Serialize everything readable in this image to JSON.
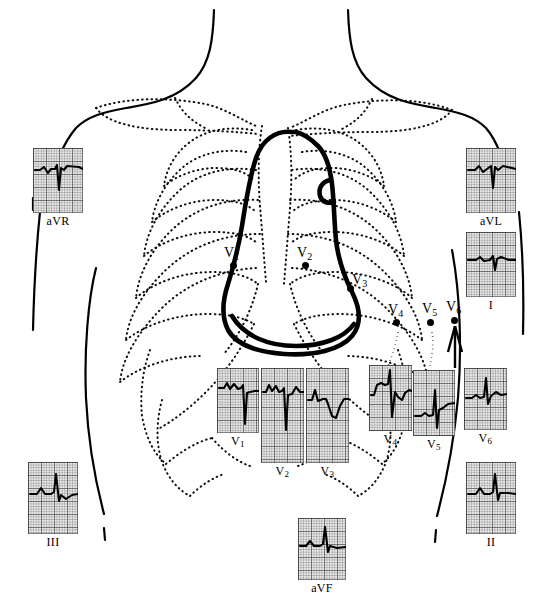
{
  "figure": {
    "kind": "anatomical-diagram"
  },
  "torso": {
    "body_outline_name": "chest-torso-outline",
    "heart_outline_name": "heart-silhouette",
    "ribcage_name": "ribcage-dotted-outline",
    "stroke_color": "#000000",
    "dotted_color": "#111111"
  },
  "electrodes": [
    {
      "id": "V1",
      "label": "V",
      "sub": "1",
      "dot_x": 233,
      "dot_y": 265,
      "label_x": 224,
      "label_y": 247
    },
    {
      "id": "V2",
      "label": "V",
      "sub": "2",
      "dot_x": 305,
      "dot_y": 265,
      "label_x": 297,
      "label_y": 247
    },
    {
      "id": "V3",
      "label": "V",
      "sub": "3",
      "dot_x": 350,
      "dot_y": 288,
      "label_x": 352,
      "label_y": 272
    },
    {
      "id": "V4",
      "label": "V",
      "sub": "4",
      "dot_x": 396,
      "dot_y": 322,
      "label_x": 390,
      "label_y": 304
    },
    {
      "id": "V5",
      "label": "V",
      "sub": "5",
      "dot_x": 430,
      "dot_y": 322,
      "label_x": 424,
      "label_y": 303
    },
    {
      "id": "V6",
      "label": "V",
      "sub": "6",
      "dot_x": 454,
      "dot_y": 320,
      "label_x": 448,
      "label_y": 300
    }
  ],
  "strips": [
    {
      "id": "aVR",
      "label": "aVR",
      "sub": "",
      "x": 33,
      "y": 148,
      "w": 50,
      "h": 65,
      "label_top": 66,
      "trace": "M2,22 L7,22 L11,19 L15,25 L18,21 L22,21 L24,17 L26,42 L28,20 L31,22 L34,18 L46,19 L50,21"
    },
    {
      "id": "aVL",
      "label": "aVL",
      "sub": "",
      "x": 466,
      "y": 148,
      "w": 50,
      "h": 65,
      "label_top": 66,
      "trace": "M2,22 L9,22 L13,18 L17,24 L21,21 L25,18 L27,40 L29,19 L32,22 L37,18 L46,20 L50,21"
    },
    {
      "id": "I",
      "label": "I",
      "sub": "",
      "x": 466,
      "y": 232,
      "w": 50,
      "h": 65,
      "label_top": 66,
      "trace": "M2,28 L10,28 L14,25 L18,29 L24,28 L27,24 L29,38 L31,27 L35,25 L43,28 L50,28"
    },
    {
      "id": "II",
      "label": "II",
      "sub": "",
      "x": 466,
      "y": 462,
      "w": 50,
      "h": 72,
      "label_top": 73,
      "trace": "M2,32 L10,32 L14,26 L18,32 L24,32 L27,30 L29,12 L32,38 L34,31 L42,31 L50,32"
    },
    {
      "id": "III",
      "label": "III",
      "sub": "",
      "x": 28,
      "y": 462,
      "w": 50,
      "h": 72,
      "label_top": 73,
      "trace": "M2,32 L9,32 L13,26 L17,32 L23,32 L26,30 L28,12 L31,39 L33,33 L38,37 L44,33 L50,32"
    },
    {
      "id": "aVF",
      "label": "aVF",
      "sub": "",
      "x": 298,
      "y": 518,
      "w": 48,
      "h": 62,
      "label_top": 63,
      "trace": "M2,28 L8,28 L12,23 L16,28 L22,28 L25,26 L27,9 L30,34 L32,28 L39,30 L48,29"
    },
    {
      "id": "V1",
      "label": "V",
      "sub": "1",
      "x": 217,
      "y": 368,
      "w": 42,
      "h": 65,
      "label_top": 66,
      "trace": "M2,20 L7,20 L10,15 L13,21 L17,16 L21,21 L24,20 L26,17 L28,56 L30,25 L33,24 L38,23 L42,23"
    },
    {
      "id": "V2",
      "label": "V",
      "sub": "2",
      "x": 261,
      "y": 368,
      "w": 43,
      "h": 95,
      "label_top": 96,
      "trace": "M2,24 L5,24 L8,17 L11,23 L15,18 L18,24 L21,23 L23,20 L25,62 L27,27 L31,26 L35,19 L39,24 L43,24"
    },
    {
      "id": "V3",
      "label": "V",
      "sub": "3",
      "x": 306,
      "y": 368,
      "w": 43,
      "h": 95,
      "label_top": 96,
      "trace": "M2,32 L6,32 L9,22 L12,33 L17,31 L20,31 L22,36 L26,48 L30,50 L34,38 L38,31 L43,31"
    },
    {
      "id": "V4",
      "label": "V",
      "sub": "4",
      "x": 369,
      "y": 365,
      "w": 43,
      "h": 66,
      "label_top": 67,
      "trace": "M2,30 L5,30 L8,20 L12,18 L16,20 L19,19 L21,5 L23,52 L26,27 L29,32 L33,35 L36,28 L40,25 L43,26"
    },
    {
      "id": "V5",
      "label": "V",
      "sub": "5",
      "x": 413,
      "y": 370,
      "w": 42,
      "h": 66,
      "label_top": 67,
      "trace": "M2,46 L8,46 L12,43 L16,46 L20,45 L22,20 L24,58 L26,40 L30,38 L35,34 L42,33"
    },
    {
      "id": "V6",
      "label": "V",
      "sub": "6",
      "x": 464,
      "y": 368,
      "w": 43,
      "h": 62,
      "label_top": 63,
      "trace": "M2,30 L8,30 L12,27 L16,30 L20,29 L22,10 L24,36 L27,28 L32,24 L37,27 L43,26"
    }
  ]
}
